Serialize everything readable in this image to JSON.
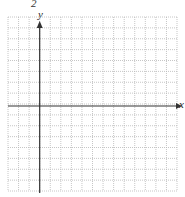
{
  "problem_number": "2",
  "axes": {
    "x_label": "x",
    "y_label": "y"
  },
  "grid": {
    "columns": 16,
    "rows": 16,
    "left": 8,
    "top": 17,
    "right": 177,
    "bottom": 191,
    "y_axis_column": 3,
    "x_axis_row": 8,
    "line_style": "dotted",
    "grid_color": "#b8b8b8",
    "axis_color": "#333333"
  }
}
